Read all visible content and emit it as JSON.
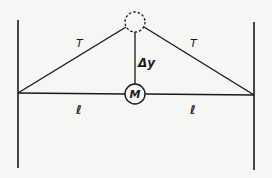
{
  "diagram": {
    "title": "",
    "labels": {
      "tension_left": "T",
      "tension_right": "T",
      "displacement": "Δy",
      "mass": "M",
      "length_left": "ℓ",
      "length_right": "ℓ"
    },
    "colors": {
      "stroke": "#1a1a1a",
      "background": "#f6f6f4"
    }
  }
}
